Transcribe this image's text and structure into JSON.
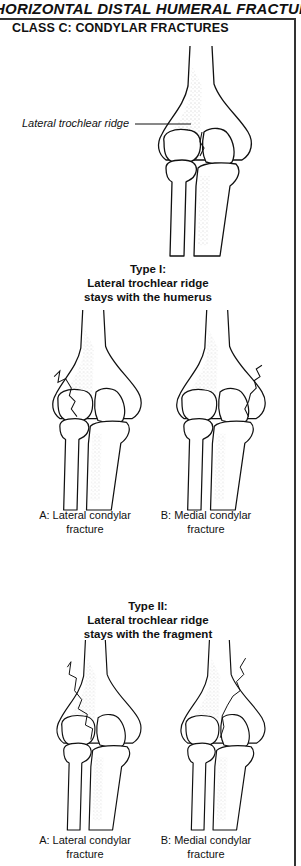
{
  "page": {
    "title": "HORIZONTAL DISTAL HUMERAL FRACTURES",
    "class_title": "CLASS C: CONDYLAR FRACTURES"
  },
  "top_figure": {
    "callout_label": "Lateral trochlear ridge"
  },
  "type1": {
    "heading_line1": "Type I:",
    "heading_line2": "Lateral trochlear ridge",
    "heading_line3": "stays with the humerus",
    "figures": [
      {
        "caption_line1": "A: Lateral condylar",
        "caption_line2": "fracture"
      },
      {
        "caption_line1": "B: Medial condylar",
        "caption_line2": "fracture"
      }
    ]
  },
  "type2": {
    "heading_line1": "Type II:",
    "heading_line2": "Lateral trochlear ridge",
    "heading_line3": "stays with the fragment",
    "figures": [
      {
        "caption_line1": "A: Lateral condylar",
        "caption_line2": "fracture"
      },
      {
        "caption_line1": "B: Medial condylar",
        "caption_line2": "fracture"
      }
    ]
  }
}
